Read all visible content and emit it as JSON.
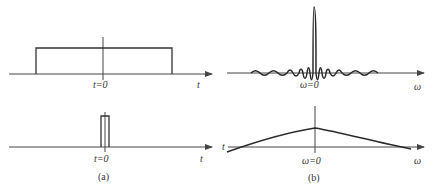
{
  "figure": {
    "panels": [
      {
        "id": "a-top",
        "description": "Wide rectangular pulse in time domain",
        "axis_label": "t",
        "origin_label": "t=0"
      },
      {
        "id": "b-top",
        "description": "Narrow sinc-like spectrum (Fourier transform of wide pulse)",
        "axis_label": "ω",
        "origin_label": "ω=0"
      },
      {
        "id": "a-bottom",
        "description": "Narrow rectangular pulse in time domain",
        "axis_label": "t",
        "origin_label": "t=0"
      },
      {
        "id": "b-bottom",
        "description": "Wide, flat spectrum (Fourier transform of narrow pulse)",
        "axis_label": "ω",
        "origin_label": "ω=0",
        "left_edge_label": "t"
      }
    ],
    "captions": {
      "left": "(a)",
      "right": "(b)"
    },
    "colors": {
      "line": "#333333",
      "background": "#ffffff"
    }
  }
}
